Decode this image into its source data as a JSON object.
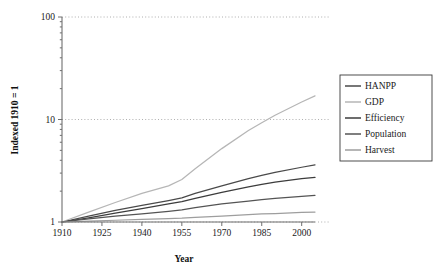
{
  "chart_data": {
    "type": "line",
    "title": "",
    "xlabel": "Year",
    "ylabel": "Indexed 1910 = 1",
    "xlim": [
      1910,
      2005
    ],
    "ylim": [
      1,
      100
    ],
    "yscale": "log",
    "grid": true,
    "legend_position": "right",
    "x": [
      1910,
      1920,
      1930,
      1940,
      1950,
      1955,
      1960,
      1970,
      1980,
      1985,
      1990,
      2000,
      2005
    ],
    "xticks": [
      "1910",
      "1925",
      "1940",
      "1955",
      "1970",
      "1985",
      "2000"
    ],
    "xtick_values": [
      1910,
      1925,
      1940,
      1955,
      1970,
      1985,
      2000
    ],
    "yticks": [
      "1",
      "10",
      "100"
    ],
    "ytick_values": [
      1,
      10,
      100
    ],
    "series": [
      {
        "name": "HANPP",
        "color": "#4a4a4a",
        "values": [
          1.0,
          1.14,
          1.3,
          1.45,
          1.62,
          1.72,
          1.9,
          2.25,
          2.65,
          2.85,
          3.05,
          3.42,
          3.6
        ]
      },
      {
        "name": "GDP",
        "color": "#b6b6b6",
        "values": [
          1.0,
          1.25,
          1.55,
          1.9,
          2.25,
          2.6,
          3.3,
          5.2,
          7.8,
          9.3,
          11.0,
          14.8,
          17.0
        ]
      },
      {
        "name": "Efficiency",
        "color": "#3c3c3c",
        "values": [
          1.0,
          1.1,
          1.22,
          1.35,
          1.5,
          1.58,
          1.7,
          1.95,
          2.2,
          2.33,
          2.45,
          2.65,
          2.72
        ]
      },
      {
        "name": "Population",
        "color": "#545454",
        "values": [
          1.0,
          1.07,
          1.14,
          1.2,
          1.27,
          1.31,
          1.38,
          1.5,
          1.6,
          1.65,
          1.7,
          1.78,
          1.82
        ]
      },
      {
        "name": "Harvest",
        "color": "#9e9e9e",
        "values": [
          1.0,
          1.02,
          1.04,
          1.06,
          1.08,
          1.09,
          1.11,
          1.14,
          1.18,
          1.2,
          1.21,
          1.24,
          1.25
        ]
      }
    ]
  },
  "legend": {
    "entries": [
      {
        "label": "HANPP"
      },
      {
        "label": "GDP"
      },
      {
        "label": "Efficiency"
      },
      {
        "label": "Population"
      },
      {
        "label": "Harvest"
      }
    ]
  }
}
